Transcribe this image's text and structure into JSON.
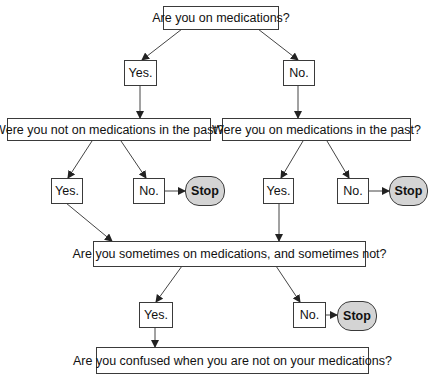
{
  "flowchart": {
    "q1": "Are you on medications?",
    "q1_yes": "Yes.",
    "q1_no": "No.",
    "q2_left": "Were you not on medications in the past?",
    "q2_left_yes": "Yes.",
    "q2_left_no": "No.",
    "q2_left_stop": "Stop",
    "q2_right": "Were you on medications in the past?",
    "q2_right_yes": "Yes.",
    "q2_right_no": "No.",
    "q2_right_stop": "Stop",
    "q3": "Are you sometimes on medications, and sometimes not?",
    "q3_yes": "Yes.",
    "q3_no": "No.",
    "q3_stop": "Stop",
    "q4": "Are you confused when you are not on your medications?"
  },
  "colors": {
    "line": "#3a3a3a",
    "stop_fill": "#d4d4d4",
    "box_fill": "#ffffff"
  }
}
